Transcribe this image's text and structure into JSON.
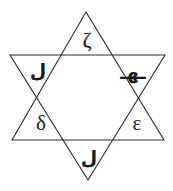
{
  "figure": {
    "shape": "hexagram",
    "stroke_color": "#2b2b2b",
    "fill_color": "none",
    "background_color": "#ffffff",
    "stroke_width": "1"
  },
  "labels": {
    "top": {
      "name": "zeta",
      "text": "ζ",
      "script": "greek"
    },
    "lower_left": {
      "name": "delta",
      "text": "δ",
      "script": "greek"
    },
    "lower_right": {
      "name": "epsilon",
      "text": "ε",
      "script": "greek"
    },
    "left": {
      "name": "ink-mark-left",
      "text": "ل",
      "script": "arabic"
    },
    "right": {
      "name": "ink-mark-right",
      "text": "ـهـ",
      "script": "arabic"
    },
    "bottom": {
      "name": "ink-mark-bottom",
      "text": "ل",
      "script": "arabic"
    }
  },
  "geometry": {
    "upward_triangle_points": "86,12 164,140 12,140",
    "downward_triangle_points": "10,55 165,55 88,180"
  }
}
